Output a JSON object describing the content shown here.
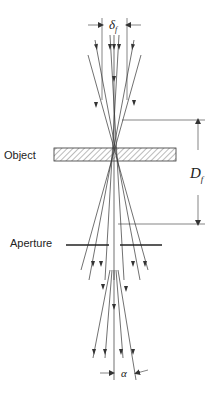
{
  "labels": {
    "object": "Object",
    "aperture": "Aperture",
    "delta_f": "δ",
    "delta_f_sub": "f",
    "D_f": "D",
    "D_f_sub": "f",
    "alpha": "α"
  },
  "colors": {
    "line": "#333333",
    "text": "#222222",
    "background": "#ffffff"
  }
}
